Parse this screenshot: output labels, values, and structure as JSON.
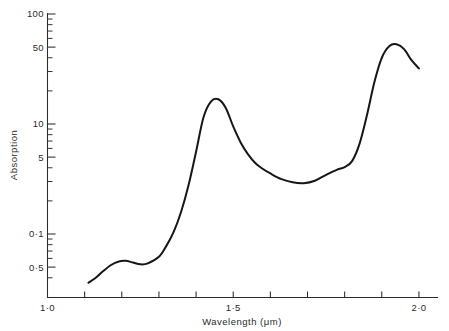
{
  "chart_data": {
    "type": "line",
    "title": "",
    "subtitle": "",
    "xlabel": "Wavelength (μm)",
    "ylabel": "Absorption",
    "xscale": "linear",
    "yscale": "log",
    "xlim": [
      1.0,
      2.05
    ],
    "ylim": [
      0.3,
      100
    ],
    "grid": false,
    "legend": null,
    "x_ticklabels": [
      "1·0",
      "1·5",
      "2·0"
    ],
    "x_ticklabel_values": [
      1.0,
      1.5,
      2.0
    ],
    "x_major_ticks": [
      1.0,
      1.1,
      1.2,
      1.3,
      1.4,
      1.5,
      1.6,
      1.7,
      1.8,
      1.9,
      2.0
    ],
    "y_ticklabels": [
      "100",
      "50",
      "10",
      "5",
      "0·1",
      "0·5"
    ],
    "y_ticklabel_values": [
      100,
      50,
      10,
      5,
      1,
      0.5
    ],
    "y_major_ticks": [
      100,
      50,
      10,
      5,
      1,
      0.5
    ],
    "y_minor_ticks": [
      90,
      80,
      70,
      60,
      40,
      30,
      20,
      9,
      8,
      7,
      6,
      4,
      3,
      2,
      0.9,
      0.8,
      0.7,
      0.6,
      0.4
    ],
    "series": [
      {
        "name": "Absorption",
        "color": "#161616",
        "x": [
          1.11,
          1.13,
          1.15,
          1.17,
          1.19,
          1.21,
          1.23,
          1.25,
          1.27,
          1.3,
          1.32,
          1.34,
          1.36,
          1.38,
          1.4,
          1.42,
          1.44,
          1.46,
          1.48,
          1.5,
          1.52,
          1.54,
          1.56,
          1.58,
          1.6,
          1.63,
          1.66,
          1.69,
          1.72,
          1.75,
          1.78,
          1.8,
          1.82,
          1.84,
          1.86,
          1.88,
          1.9,
          1.92,
          1.94,
          1.96,
          1.98,
          2.0
        ],
        "y": [
          0.36,
          0.4,
          0.46,
          0.52,
          0.56,
          0.57,
          0.55,
          0.53,
          0.54,
          0.62,
          0.78,
          1.05,
          1.6,
          2.8,
          5.6,
          11.5,
          16.0,
          16.8,
          14.0,
          9.5,
          6.8,
          5.3,
          4.4,
          3.9,
          3.55,
          3.15,
          2.95,
          2.9,
          3.05,
          3.45,
          3.85,
          4.05,
          4.6,
          6.6,
          12.0,
          24.0,
          40.0,
          51.0,
          53.0,
          48.0,
          38.0,
          32.0
        ],
        "annotations": [
          {
            "label": "first absorption peak",
            "x": 1.455,
            "y": 16.8
          },
          {
            "label": "shoulder",
            "x": 1.21,
            "y": 0.57
          },
          {
            "label": "minimum",
            "x": 1.245,
            "y": 0.53
          },
          {
            "label": "broad minimum",
            "x": 1.7,
            "y": 2.9
          },
          {
            "label": "small bump",
            "x": 1.805,
            "y": 4.1
          },
          {
            "label": "main peak",
            "x": 1.935,
            "y": 53.0
          },
          {
            "label": "curve start",
            "x": 1.11,
            "y": 0.36
          },
          {
            "label": "curve end",
            "x": 2.0,
            "y": 32.0
          }
        ]
      }
    ]
  },
  "axes": {
    "x_title": "Wavelength (μm)",
    "y_title": "Absorption"
  },
  "marks": {
    "top_smudge": " "
  }
}
